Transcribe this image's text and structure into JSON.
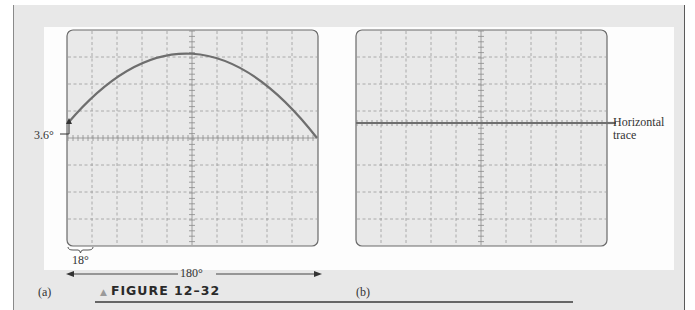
{
  "figure": {
    "caption": "FIGURE 12–32",
    "caption_marker": "triangle-up-icon"
  },
  "panel_a": {
    "label": "(a)",
    "annotation_offset": "3.6°",
    "annotation_division": "18°",
    "annotation_span": "180°"
  },
  "panel_b": {
    "label": "(b)",
    "annotation_trace_line1": "Horizontal",
    "annotation_trace_line2": "trace"
  },
  "colors": {
    "frame_bg": "#e8e8e8",
    "screen_bg": "#e9e9e9",
    "trace": "#6a6a6a",
    "grid": "#9a9a9a"
  },
  "chart_data": [
    {
      "type": "line",
      "title": "(a) Oscilloscope display: half-cycle of sine wave offset by 3.6°",
      "xlabel": "phase (degrees)",
      "ylabel": "amplitude (divisions)",
      "grid": {
        "columns": 10,
        "rows": 8
      },
      "degrees_per_division": 18,
      "screen_span_degrees": 180,
      "phase_offset_degrees": 3.6,
      "x": [
        0,
        18,
        36,
        54,
        72,
        90,
        108,
        126,
        144,
        162,
        180
      ],
      "y_divisions_above_center": [
        0.2,
        1.5,
        2.5,
        3.2,
        3.6,
        3.7,
        3.6,
        3.2,
        2.5,
        1.5,
        0.0
      ],
      "ylim": [
        -4,
        4
      ]
    },
    {
      "type": "line",
      "title": "(b) Oscilloscope display: horizontal trace",
      "grid": {
        "columns": 10,
        "rows": 8
      },
      "x": [
        0,
        180
      ],
      "y_divisions_above_center": [
        0,
        0
      ],
      "ylim": [
        -4,
        4
      ]
    }
  ]
}
